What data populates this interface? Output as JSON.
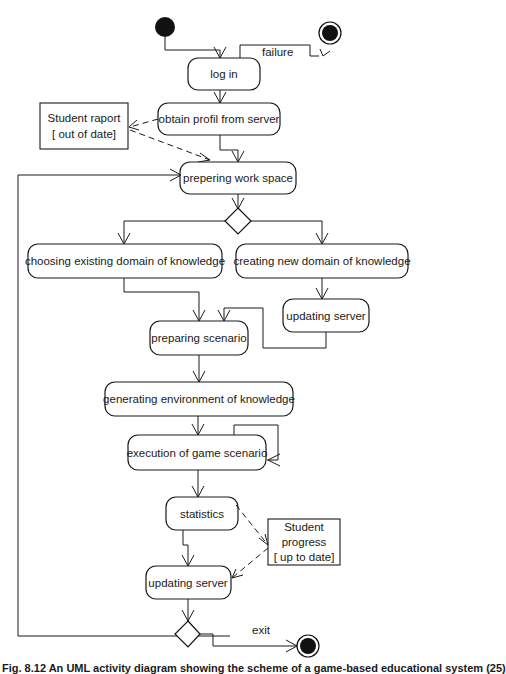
{
  "diagram": {
    "type": "uml-activity",
    "nodes": {
      "log_in": "log in",
      "obtain_profil": "obtain profil from server",
      "prepering_work_space": "prepering work space",
      "choosing_existing": "choosing existing domain of knowledge",
      "creating_new": "creating new domain of knowledge",
      "updating_server_1": "updating server",
      "preparing_scenario": "preparing scenario",
      "generating_env": "generating environment of knowledge",
      "execution": "execution of game scenario",
      "statistics": "statistics",
      "updating_server_2": "updating server"
    },
    "objects": {
      "student_raport_line1": "Student raport",
      "student_raport_line2": "[ out of date]",
      "student_progress_line1": "Student",
      "student_progress_line2": "progress",
      "student_progress_line3": "[ up to date]"
    },
    "guards": {
      "failure": "failure",
      "exit": "exit"
    }
  },
  "caption": "Fig. 8.12 An UML activity diagram showing the scheme of a game-based educational system (25)"
}
